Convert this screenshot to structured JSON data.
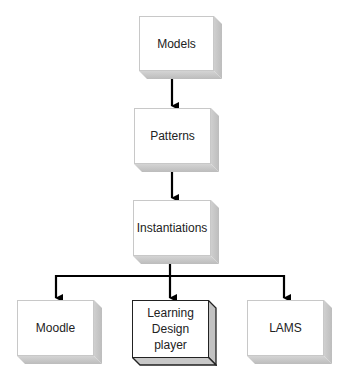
{
  "diagram": {
    "type": "hierarchy-flow",
    "nodes": [
      {
        "id": "models",
        "label": "Models",
        "x": 139,
        "y": 16,
        "w": 75,
        "h": 55,
        "highlight": false
      },
      {
        "id": "patterns",
        "label": "Patterns",
        "x": 134,
        "y": 108,
        "w": 77,
        "h": 56,
        "highlight": false
      },
      {
        "id": "instantiations",
        "label": "Instantiations",
        "x": 133,
        "y": 200,
        "w": 78,
        "h": 56,
        "highlight": false
      },
      {
        "id": "moodle",
        "label": "Moodle",
        "x": 17,
        "y": 300,
        "w": 77,
        "h": 56,
        "highlight": false
      },
      {
        "id": "ld_player",
        "label": "Learning\nDesign\nplayer",
        "label_lines": [
          "Learning",
          "Design",
          "player"
        ],
        "x": 132,
        "y": 300,
        "w": 76,
        "h": 57,
        "highlight": true
      },
      {
        "id": "lams",
        "label": "LAMS",
        "x": 247,
        "y": 300,
        "w": 77,
        "h": 56,
        "highlight": false
      }
    ],
    "edges": [
      {
        "from": "models",
        "to": "patterns"
      },
      {
        "from": "patterns",
        "to": "instantiations"
      },
      {
        "from": "instantiations",
        "to": "moodle"
      },
      {
        "from": "instantiations",
        "to": "ld_player"
      },
      {
        "from": "instantiations",
        "to": "lams"
      }
    ]
  },
  "labels": {
    "models": "Models",
    "patterns": "Patterns",
    "instantiations": "Instantiations",
    "moodle": "Moodle",
    "ld_line1": "Learning",
    "ld_line2": "Design",
    "ld_line3": "player",
    "lams": "LAMS"
  },
  "colors": {
    "face": "#ffffff",
    "side": "#c4c4c4",
    "line": "#000000",
    "text": "#222222"
  }
}
